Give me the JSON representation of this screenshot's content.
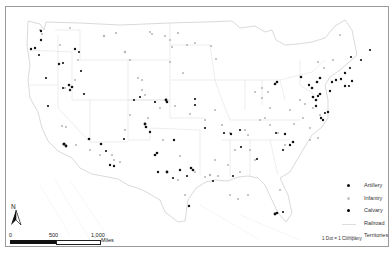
{
  "map": {
    "title": "",
    "region": "Contiguous United States",
    "dot_unit": "1 Dot = 1 Company",
    "colors": {
      "artillery": "#111111",
      "infantry": "#b3b3b3",
      "cavalry": "#000000",
      "railroad": "#d6d6d6",
      "territories": "#cfcfcf",
      "frame": "#9a9a9a"
    }
  },
  "legend": {
    "items": [
      {
        "label": "Artillery",
        "type": "point",
        "color": "#111111"
      },
      {
        "label": "Infantry",
        "type": "point",
        "color": "#b3b3b3"
      },
      {
        "label": "Calvary",
        "type": "point",
        "color": "#000000"
      },
      {
        "label": "Railroad",
        "type": "line",
        "color": "#d6d6d6"
      },
      {
        "label": "Territories",
        "type": "line",
        "color": "#cfcfcf"
      }
    ],
    "note": "1 Dot = 1 Company"
  },
  "north_arrow": {
    "label": "N"
  },
  "scale_bar": {
    "ticks": [
      "0",
      "500",
      "1,000"
    ],
    "unit": "Miles"
  }
}
